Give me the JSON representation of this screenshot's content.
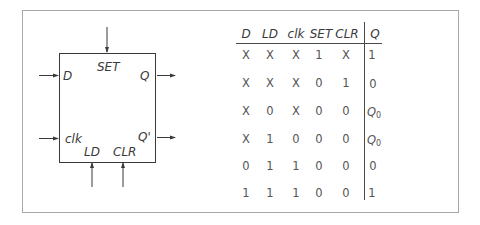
{
  "block": {
    "inputs": {
      "d": "D",
      "clk": "clk",
      "set": "SET",
      "ld": "LD",
      "clr": "CLR"
    },
    "outputs": {
      "q": "Q",
      "q_bar": "Q'"
    }
  },
  "truth_table": {
    "headers": [
      "D",
      "LD",
      "clk",
      "SET",
      "CLR",
      "Q"
    ],
    "rows": [
      [
        "X",
        "X",
        "X",
        "1",
        "X",
        "1"
      ],
      [
        "X",
        "X",
        "X",
        "0",
        "1",
        "0"
      ],
      [
        "X",
        "0",
        "X",
        "0",
        "0",
        "Q0"
      ],
      [
        "X",
        "1",
        "0",
        "0",
        "0",
        "Q0"
      ],
      [
        "0",
        "1",
        "1",
        "0",
        "0",
        "0"
      ],
      [
        "1",
        "1",
        "1",
        "0",
        "0",
        "1"
      ]
    ],
    "q0": {
      "main": "Q",
      "sub": "0"
    }
  },
  "colors": {
    "stroke": "#3a3a3a",
    "frame": "#a8a8a8",
    "text": "#555555"
  }
}
